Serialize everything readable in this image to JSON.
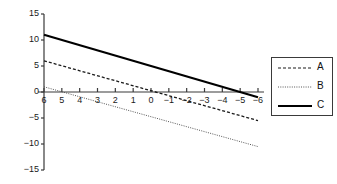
{
  "chart_data": {
    "type": "line",
    "title": "",
    "xlabel": "",
    "ylabel": "",
    "xlim": [
      6,
      -6
    ],
    "ylim": [
      -15,
      15
    ],
    "x_ticks": [
      6,
      5,
      4,
      3,
      2,
      1,
      0,
      -1,
      -2,
      -3,
      -4,
      -5,
      -6
    ],
    "x_tick_labels": [
      "6",
      "5",
      "4",
      "3",
      "2",
      "1",
      "0",
      "-1",
      "-2",
      "-3",
      "-4",
      "-5",
      "-6"
    ],
    "y_ticks": [
      15,
      10,
      5,
      0,
      -5,
      -10,
      -15
    ],
    "y_tick_labels": [
      "15",
      "10",
      "5",
      "0",
      "-5",
      "-10",
      "-15"
    ],
    "x_axis_direction": "reversed",
    "grid": false,
    "legend_position": "right-outside",
    "series": [
      {
        "name": "A",
        "style": "dashed",
        "color": "#1a1a1a",
        "x": [
          6,
          -6
        ],
        "values": [
          6,
          -5.5
        ]
      },
      {
        "name": "B",
        "style": "dotted",
        "color": "#555555",
        "x": [
          6,
          -6
        ],
        "values": [
          1,
          -10.5
        ]
      },
      {
        "name": "C",
        "style": "solid",
        "color": "#000000",
        "x": [
          6,
          -6
        ],
        "values": [
          11,
          -1
        ]
      }
    ]
  },
  "legend": {
    "entries": [
      {
        "label": "A"
      },
      {
        "label": "B"
      },
      {
        "label": "C"
      }
    ]
  }
}
